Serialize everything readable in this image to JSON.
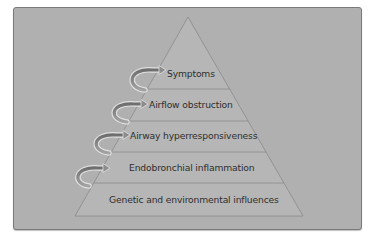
{
  "diagram": {
    "type": "pyramid",
    "colors": {
      "panel": "#b0b0b0",
      "pyramid_fill": "#b5b5b5",
      "pyramid_stroke": "#8a8a8a",
      "arrow_fill": "#8c8c8c",
      "arrow_outline": "#dcdcdc",
      "text": "#2e2e2e"
    },
    "layers": [
      {
        "level": 5,
        "label": "Symptoms"
      },
      {
        "level": 4,
        "label": "Airflow obstruction"
      },
      {
        "level": 3,
        "label": "Airway hyperresponsiveness"
      },
      {
        "level": 2,
        "label": "Endobronchial inflammation"
      },
      {
        "level": 1,
        "label": "Genetic and environmental influences"
      }
    ],
    "arrows": [
      {
        "from": "Endobronchial inflammation",
        "to": "Airway hyperresponsiveness"
      },
      {
        "from": "Airway hyperresponsiveness",
        "to": "Airflow obstruction"
      },
      {
        "from": "Airflow obstruction",
        "to": "Symptoms"
      },
      {
        "from": "Symptoms",
        "to": "apex"
      }
    ]
  }
}
